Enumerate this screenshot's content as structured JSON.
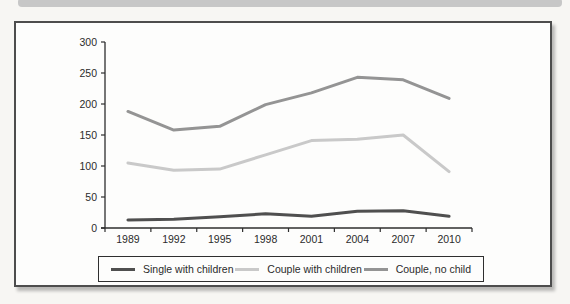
{
  "chart_data": {
    "type": "line",
    "categories": [
      "1989",
      "1992",
      "1995",
      "1998",
      "2001",
      "2004",
      "2007",
      "2010"
    ],
    "series": [
      {
        "name": "Single with children",
        "color": "#4f4f4f",
        "values": [
          13,
          14,
          18,
          23,
          19,
          27,
          28,
          19
        ]
      },
      {
        "name": "Couple with children",
        "color": "#c9c9c9",
        "values": [
          105,
          93,
          95,
          118,
          141,
          143,
          150,
          91
        ]
      },
      {
        "name": "Couple, no child",
        "color": "#949494",
        "values": [
          188,
          158,
          164,
          199,
          218,
          243,
          239,
          209
        ]
      }
    ],
    "title": "",
    "xlabel": "",
    "ylabel": "",
    "ylim": [
      0,
      300
    ],
    "yticks": [
      0,
      50,
      100,
      150,
      200,
      250,
      300
    ],
    "grid": false,
    "legend_position": "bottom",
    "axis_color": "#2e2e2e",
    "text_color": "#2b2b2b",
    "frame_border_color": "#4d4d4d",
    "page_bar_color": "#c7c7c7"
  }
}
